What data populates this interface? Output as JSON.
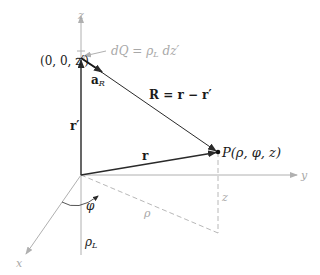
{
  "diagram": {
    "colors": {
      "vector": "#2a2a2a",
      "axis": "#b0b0b0",
      "dashed": "#b8b8b8",
      "label_dark": "#1a1a1a",
      "label_gray": "#a8a8a8"
    },
    "axes": {
      "z_label": "z",
      "y_label": "y",
      "x_label": "x"
    },
    "labels": {
      "source_point": "(0, 0, z′)",
      "charge_element_lhs": "dQ",
      "charge_element_eq": "=",
      "charge_element_rho": "ρ",
      "charge_element_rho_sub": "L",
      "charge_element_rhs": "dz′",
      "unit_vector": "a",
      "unit_vector_sub": "R",
      "separation_vector": "R = r − r′",
      "source_vector": "r′",
      "field_vector": "r",
      "field_point": "P(ρ, φ, z)",
      "angle": "φ",
      "radial_distance": "ρ",
      "height": "z",
      "line_charge": "ρ",
      "line_charge_sub": "L"
    }
  }
}
